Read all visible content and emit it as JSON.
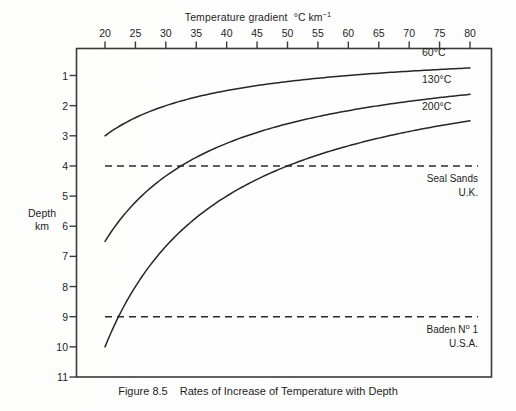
{
  "figure": {
    "caption_number": "Figure 8.5",
    "caption_text": "Rates of Increase of Temperature with Depth"
  },
  "axes": {
    "x_title_main": "Temperature gradient",
    "x_title_unit": "°C km",
    "x_title_exponent": "−1",
    "y_title_line1": "Depth",
    "y_title_line2": "km"
  },
  "chart_data": {
    "type": "line",
    "title": "Rates of Increase of Temperature with Depth",
    "xlabel": "Temperature gradient °C km−1",
    "ylabel": "Depth km",
    "xlim": [
      20,
      80
    ],
    "ylim": [
      11,
      0
    ],
    "y_inverted": true,
    "x_axis_position": "top",
    "grid": false,
    "legend": "inline-right-labels",
    "xticks": [
      20,
      25,
      30,
      35,
      40,
      45,
      50,
      55,
      60,
      65,
      70,
      75,
      80
    ],
    "xticklabels": [
      "20",
      "25",
      "30",
      "35",
      "40",
      "45",
      "50",
      "55",
      "60",
      "65",
      "70",
      "75",
      "80"
    ],
    "yticks": [
      1,
      2,
      3,
      4,
      5,
      6,
      7,
      8,
      9,
      10,
      11
    ],
    "yticklabels": [
      "1",
      "2",
      "3",
      "4",
      "5",
      "6",
      "7",
      "8",
      "9",
      "10",
      "11"
    ],
    "relation": "depth_km = temperature_C / gradient_C_per_km",
    "series": [
      {
        "name": "60°C",
        "label": "60°C",
        "temperature_C": 60,
        "x": [
          20,
          25,
          30,
          35,
          40,
          45,
          50,
          55,
          60,
          65,
          70,
          75,
          80
        ],
        "values": [
          3.0,
          2.4,
          2.0,
          1.71,
          1.5,
          1.33,
          1.2,
          1.09,
          1.0,
          0.92,
          0.86,
          0.8,
          0.75
        ]
      },
      {
        "name": "130°C",
        "label": "130°C",
        "temperature_C": 130,
        "x": [
          20,
          25,
          30,
          35,
          40,
          45,
          50,
          55,
          60,
          65,
          70,
          75,
          80
        ],
        "values": [
          6.5,
          5.2,
          4.33,
          3.71,
          3.25,
          2.89,
          2.6,
          2.36,
          2.17,
          2.0,
          1.86,
          1.73,
          1.63
        ]
      },
      {
        "name": "200°C",
        "label": "200°C",
        "temperature_C": 200,
        "x": [
          20,
          25,
          30,
          35,
          40,
          45,
          50,
          55,
          60,
          65,
          70,
          75,
          80
        ],
        "values": [
          10.0,
          8.0,
          6.67,
          5.71,
          5.0,
          4.44,
          4.0,
          3.64,
          3.33,
          3.08,
          2.86,
          2.67,
          2.5
        ]
      }
    ],
    "reference_lines": [
      {
        "name": "seal-sands",
        "depth_km": 4,
        "style": "dashed",
        "label_line1": "Seal Sands",
        "label_line2": "U.K."
      },
      {
        "name": "baden-no-1",
        "depth_km": 9,
        "style": "dashed",
        "label_line1": "Baden Nº 1",
        "label_line2": "U.S.A."
      }
    ]
  },
  "annotations": {
    "seal_sands_line1": "Seal Sands",
    "seal_sands_line2": "U.K.",
    "baden_line1_pre": "Baden N",
    "baden_line1_ord": "o",
    "baden_line1_post": " 1",
    "baden_line2": "U.S.A."
  },
  "curve_labels": {
    "c60": "60°C",
    "c130": "130°C",
    "c200": "200°C"
  },
  "colors": {
    "ink": "#1d1d1d",
    "frame": "#3a3a3a",
    "paper": "#fefefe"
  }
}
